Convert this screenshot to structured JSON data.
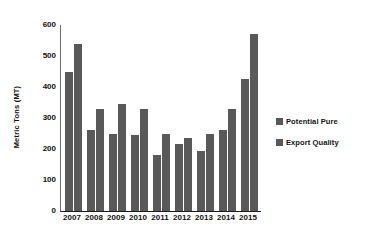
{
  "chart_data": {
    "type": "bar",
    "title": "",
    "xlabel": "",
    "ylabel": "Metric Tons (MT)",
    "categories": [
      "2007",
      "2008",
      "2009",
      "2010",
      "2011",
      "2012",
      "2013",
      "2014",
      "2015"
    ],
    "series": [
      {
        "name": "Potential Pure",
        "values": [
          450,
          260,
          250,
          245,
          180,
          215,
          195,
          260,
          425
        ]
      },
      {
        "name": "Export Quality",
        "values": [
          540,
          330,
          345,
          330,
          250,
          235,
          250,
          330,
          570
        ]
      }
    ],
    "ylim": [
      0,
      600
    ],
    "yticks": [
      600,
      500,
      400,
      300,
      200,
      100,
      0
    ],
    "grid": false,
    "legend_position": "right",
    "bar_color": "#595959",
    "axis_color": "#1d1d1d",
    "background": "#ffffff"
  }
}
